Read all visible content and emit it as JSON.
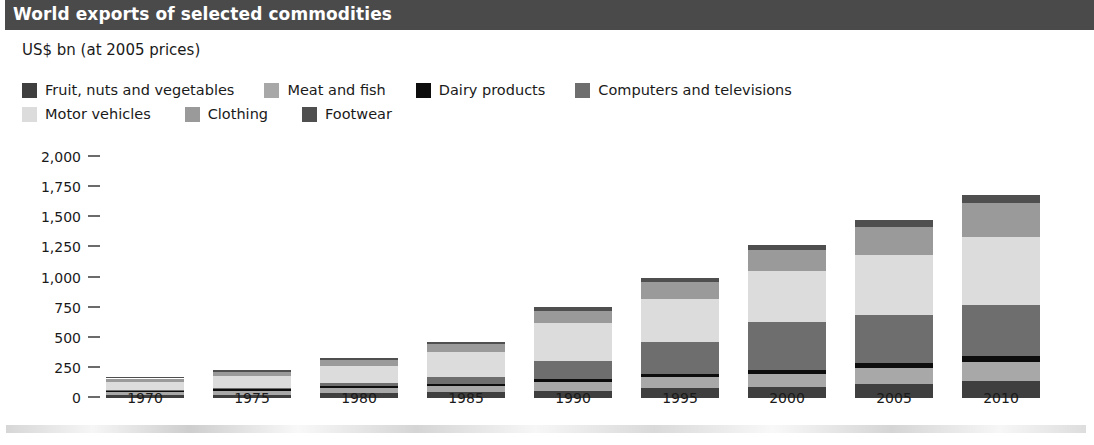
{
  "header": {
    "title": "World exports of selected commodities"
  },
  "subtitle": "US$ bn (at 2005 prices)",
  "legend": {
    "rows": [
      [
        {
          "label": "Fruit, nuts and vegetables",
          "color": "#3f3f3f"
        },
        {
          "label": "Meat and fish",
          "color": "#a8a8a8"
        },
        {
          "label": "Dairy products",
          "color": "#0d0d0d"
        },
        {
          "label": "Computers and televisions",
          "color": "#6e6e6e"
        }
      ],
      [
        {
          "label": "Motor vehicles",
          "color": "#dcdcdc"
        },
        {
          "label": "Clothing",
          "color": "#9a9a9a"
        },
        {
          "label": "Footwear",
          "color": "#4f4f4f"
        }
      ]
    ]
  },
  "chart_data": {
    "type": "bar",
    "stacked": true,
    "title": "World exports of selected commodities",
    "subtitle": "US$ bn (at 2005 prices)",
    "xlabel": "",
    "ylabel": "US$ bn (at 2005 prices)",
    "ylim": [
      0,
      2000
    ],
    "yticks": [
      0,
      250,
      500,
      750,
      1000,
      1250,
      1500,
      1750,
      2000
    ],
    "ytick_labels": [
      "0",
      "250",
      "500",
      "750",
      "1,000",
      "1,250",
      "1,500",
      "1,750",
      "2,000"
    ],
    "grid": false,
    "legend_position": "top",
    "categories": [
      "1970",
      "1975",
      "1980",
      "1985",
      "1990",
      "1995",
      "2000",
      "2005",
      "2010"
    ],
    "series": [
      {
        "name": "Fruit, nuts and vegetables",
        "color": "#3f3f3f",
        "values": [
          22,
          28,
          38,
          46,
          62,
          80,
          92,
          118,
          140
        ]
      },
      {
        "name": "Meat and fish",
        "color": "#a8a8a8",
        "values": [
          26,
          32,
          44,
          54,
          74,
          94,
          108,
          132,
          158
        ]
      },
      {
        "name": "Dairy products",
        "color": "#0d0d0d",
        "values": [
          10,
          12,
          16,
          18,
          24,
          28,
          32,
          40,
          48
        ]
      },
      {
        "name": "Computers and televisions",
        "color": "#6e6e6e",
        "values": [
          6,
          14,
          30,
          60,
          150,
          260,
          400,
          400,
          430
        ]
      },
      {
        "name": "Motor vehicles",
        "color": "#dcdcdc",
        "values": [
          72,
          96,
          134,
          200,
          310,
          360,
          420,
          500,
          560
        ]
      },
      {
        "name": "Clothing",
        "color": "#9a9a9a",
        "values": [
          26,
          36,
          52,
          70,
          104,
          140,
          176,
          230,
          280
        ]
      },
      {
        "name": "Footwear",
        "color": "#4f4f4f",
        "values": [
          8,
          11,
          15,
          20,
          28,
          36,
          44,
          56,
          68
        ]
      }
    ],
    "totals": [
      170,
      229,
      329,
      468,
      752,
      998,
      1272,
      1476,
      1684
    ]
  }
}
